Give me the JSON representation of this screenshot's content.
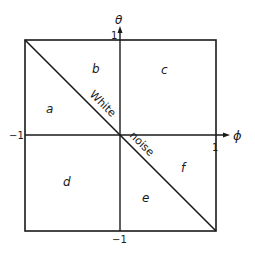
{
  "diagram": {
    "axes": {
      "vertical": {
        "label": "θ",
        "max_tick": "1",
        "min_tick": "−1"
      },
      "horizontal": {
        "label": "ϕ",
        "max_tick": "1",
        "min_tick": "−1"
      }
    },
    "diagonal": {
      "upper_text": "White",
      "lower_text": "noise"
    },
    "regions": [
      {
        "id": "a",
        "label": "a"
      },
      {
        "id": "b",
        "label": "b"
      },
      {
        "id": "c",
        "label": "c"
      },
      {
        "id": "d",
        "label": "d"
      },
      {
        "id": "e",
        "label": "e"
      },
      {
        "id": "f",
        "label": "f"
      }
    ],
    "colors": {
      "ink": "#1a1a1a",
      "background": "#ffffff"
    }
  }
}
